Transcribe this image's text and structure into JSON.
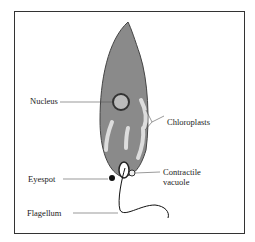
{
  "figure": {
    "labels": {
      "nucleus": "Nucleus",
      "chloroplasts": "Chloroplasts",
      "eyespot": "Eyespot",
      "contractile_vacuole_1": "Contractile",
      "contractile_vacuole_2": "vacuole",
      "flagellum": "Flagellum"
    }
  }
}
